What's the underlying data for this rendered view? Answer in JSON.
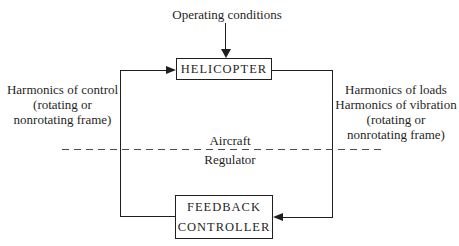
{
  "diagram": {
    "top_label": "Operating conditions",
    "helicopter_box": {
      "label": "HELICOPTER"
    },
    "feedback_box": {
      "lines": [
        "FEEDBACK",
        "CONTROLLER"
      ]
    },
    "left_label": {
      "lines": [
        "Harmonics of control",
        "(rotating or",
        "nonrotating frame)"
      ]
    },
    "right_label": {
      "lines": [
        "Harmonics of loads",
        "Harmonics of vibration",
        "(rotating or",
        "nonrotating frame)"
      ]
    },
    "divider": {
      "above_label": "Aircraft",
      "below_label": "Regulator"
    },
    "colors": {
      "line": "#1f1f1f",
      "text": "#1f1f1f",
      "background": "#ffffff",
      "dashed_line": "#4a4a4a"
    }
  }
}
